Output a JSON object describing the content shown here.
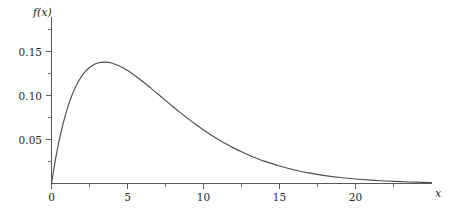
{
  "chart_data": {
    "type": "line",
    "title": "",
    "subtitle": "",
    "xlabel": "x",
    "ylabel": "f(x)",
    "xlim": [
      -0.2,
      25.1
    ],
    "ylim": [
      0.0,
      0.1935
    ],
    "grid": false,
    "legend": null,
    "x_ticks_major": [
      0,
      5,
      10,
      15,
      20
    ],
    "x_ticklabels": [
      "0",
      "5",
      "10",
      "15",
      "20"
    ],
    "x_ticks_minor": [
      2.5,
      7.5,
      12.5,
      17.5,
      22.5
    ],
    "y_ticks_major": [
      0.05,
      0.1,
      0.15
    ],
    "y_ticklabels": [
      "0.05",
      "0.10",
      "0.15"
    ],
    "y_ticks_minor": [
      0.025,
      0.075,
      0.125,
      0.175
    ],
    "series": [
      {
        "name": "f(x)",
        "color": "#4d4d4d",
        "x": [
          0.0,
          0.25,
          0.5,
          0.75,
          1.0,
          1.25,
          1.5,
          1.75,
          2.0,
          2.25,
          2.5,
          2.75,
          3.0,
          3.25,
          3.5,
          3.75,
          4.0,
          4.5,
          5.0,
          5.5,
          6.0,
          6.5,
          7.0,
          7.5,
          8.0,
          8.5,
          9.0,
          9.5,
          10.0,
          10.5,
          11.0,
          11.5,
          12.0,
          12.5,
          13.0,
          13.5,
          14.0,
          15.0,
          16.0,
          17.0,
          18.0,
          19.0,
          20.0,
          21.0,
          22.0,
          23.0,
          24.0,
          25.0
        ],
        "y": [
          0.0,
          0.0263,
          0.0485,
          0.0672,
          0.0829,
          0.0959,
          0.1066,
          0.1153,
          0.1223,
          0.1277,
          0.1318,
          0.1348,
          0.1367,
          0.1377,
          0.138,
          0.1376,
          0.1367,
          0.1333,
          0.1284,
          0.1225,
          0.1159,
          0.1089,
          0.1017,
          0.0944,
          0.0872,
          0.0802,
          0.0734,
          0.067,
          0.0609,
          0.0551,
          0.0498,
          0.0448,
          0.0402,
          0.036,
          0.0321,
          0.0286,
          0.0254,
          0.0199,
          0.0154,
          0.0118,
          0.009,
          0.0068,
          0.0051,
          0.0038,
          0.0028,
          0.0021,
          0.0015,
          0.0011
        ],
        "peak_x": 3.5,
        "peak_y": 0.152
      }
    ]
  },
  "axis_labels": {
    "y": "f(x)",
    "x": "x"
  },
  "colors": {
    "curve": "#4d4d4d",
    "axis": "#595959",
    "text": "#262626",
    "background": "#ffffff"
  }
}
